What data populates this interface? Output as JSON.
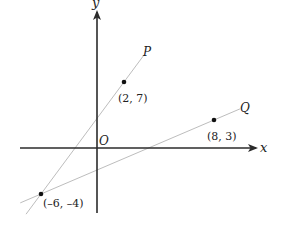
{
  "diagram": {
    "type": "coordinate-plane",
    "axes": {
      "x_label": "x",
      "y_label": "y",
      "origin_label": "O"
    },
    "points": [
      {
        "id": "A",
        "x": 2,
        "y": 7,
        "label": "(2, 7)"
      },
      {
        "id": "B",
        "x": 8,
        "y": 3,
        "label": "(8, 3)"
      },
      {
        "id": "C",
        "x": -6,
        "y": -4,
        "label": "(–6, –4)"
      }
    ],
    "lines": [
      {
        "name": "P",
        "label": "P",
        "through": [
          "C",
          "A"
        ]
      },
      {
        "name": "Q",
        "label": "Q",
        "through": [
          "C",
          "B"
        ]
      }
    ],
    "colors": {
      "axis": "#2b2b2b",
      "line": "#bdbdbd",
      "point": "#111111",
      "text": "#222222"
    }
  }
}
